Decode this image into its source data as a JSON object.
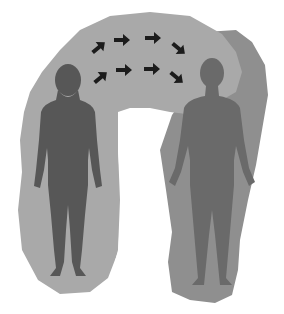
{
  "figure": {
    "colors": {
      "background": "#ffffff",
      "aura_light": "#a8a8a8",
      "aura_dark": "#8e8e8e",
      "female_figure": "#575757",
      "male_figure": "#6a6a6a",
      "arrow": "#1c1c1c"
    },
    "figures": [
      {
        "name": "female",
        "position": "left"
      },
      {
        "name": "male",
        "position": "right"
      }
    ],
    "arrows": {
      "rows": 2,
      "per_row": 4,
      "direction": "left-to-right"
    }
  }
}
